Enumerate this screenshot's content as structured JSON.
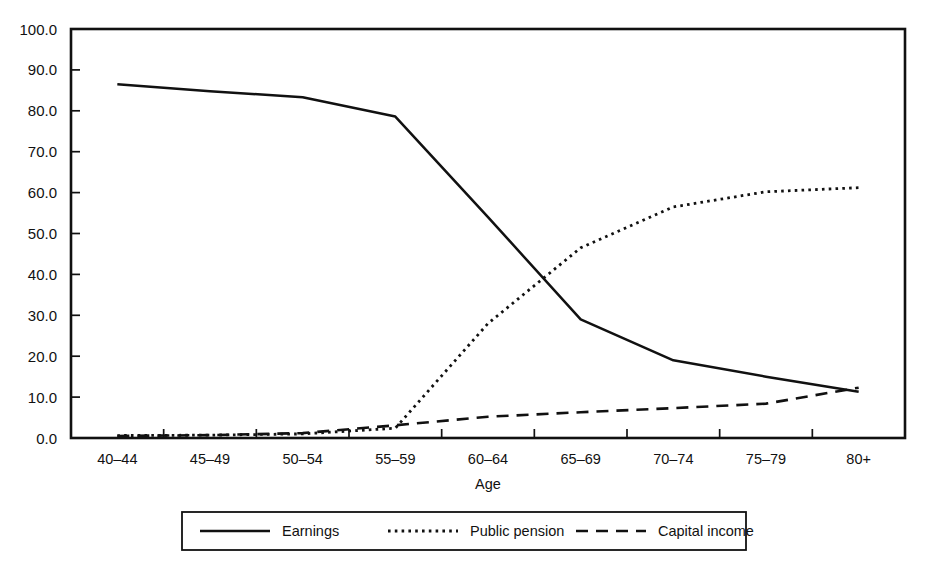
{
  "chart_data": {
    "type": "line",
    "title": "",
    "xlabel": "Age",
    "ylabel": "",
    "categories": [
      "40–44",
      "45–49",
      "50–54",
      "55–59",
      "60–64",
      "65–69",
      "70–74",
      "75–79",
      "80+"
    ],
    "x_tick_labels": [
      "40–44",
      "45–49",
      "50–54",
      "55–59",
      "60–64",
      "65–69",
      "70–74",
      "75–79",
      "80+"
    ],
    "y_tick_labels": [
      "0.0",
      "10.0",
      "20.0",
      "30.0",
      "40.0",
      "50.0",
      "60.0",
      "70.0",
      "80.0",
      "90.0",
      "100.0"
    ],
    "y_ticks": [
      0,
      10,
      20,
      30,
      40,
      50,
      60,
      70,
      80,
      90,
      100
    ],
    "ylim": [
      0,
      100
    ],
    "grid": false,
    "legend_position": "bottom",
    "series": [
      {
        "name": "Earnings",
        "style": "solid",
        "color": "#111111",
        "values": [
          86.5,
          84.8,
          83.3,
          78.6,
          54.0,
          29.0,
          19.0,
          15.0,
          11.3
        ]
      },
      {
        "name": "Public pension",
        "style": "dotted",
        "color": "#111111",
        "values": [
          0.6,
          0.7,
          1.0,
          2.4,
          28.0,
          46.5,
          56.5,
          60.2,
          61.2
        ]
      },
      {
        "name": "Capital income",
        "style": "dashed",
        "color": "#111111",
        "values": [
          0.5,
          0.7,
          1.2,
          3.1,
          5.2,
          6.3,
          7.3,
          8.4,
          12.3
        ]
      }
    ],
    "legend": [
      "Earnings",
      "Public pension",
      "Capital income"
    ]
  },
  "axis": {
    "x_label": "Age"
  }
}
